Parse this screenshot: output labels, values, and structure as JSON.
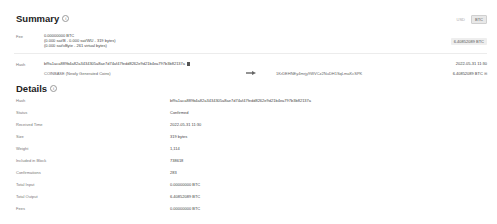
{
  "summary": {
    "title": "Summary",
    "currency_toggle": {
      "options": [
        "USD",
        "BTC"
      ],
      "selected": "BTC"
    },
    "fee": {
      "label": "Fee",
      "line1": "0.00000000 BTC",
      "line2": "(0.000 sat/B - 0.000 sat/WU - 319 bytes)",
      "line3": "(0.000 sat/vByte - 261 virtual bytes)",
      "total_badge": "6.40852089 BTC"
    },
    "hash": {
      "label": "Hash",
      "value": "bf9a1aca889b4a82a3434305a8ae7d74af47fedd8262e9d21b4ea797b3b82137a",
      "date": "2022-05-31 11:30"
    },
    "io": {
      "input": "COINBASE (Newly Generated Coins)",
      "output_address": "1KrDEHNEy4mrjy9WVCz2NuDH1SqLmaKcSPK",
      "output_amount": "6.40852089 BTC"
    }
  },
  "details": {
    "title": "Details",
    "rows": [
      {
        "label": "Hash",
        "value": "bf9a1aca889b4a82a3434305a8ae7d74af47fedd8262e9d21b4ea797b3b82137a"
      },
      {
        "label": "Status",
        "value": "Confirmed"
      },
      {
        "label": "Received Time",
        "value": "2022-05-31 11:30"
      },
      {
        "label": "Size",
        "value": "319 bytes"
      },
      {
        "label": "Weight",
        "value": "1,114"
      },
      {
        "label": "Included in Block",
        "value": "738618"
      },
      {
        "label": "Confirmations",
        "value": "283"
      },
      {
        "label": "Total Input",
        "value": "0.00000000 BTC"
      },
      {
        "label": "Total Output",
        "value": "6.40852089 BTC"
      },
      {
        "label": "Fees",
        "value": "0.00000000 BTC"
      }
    ]
  }
}
